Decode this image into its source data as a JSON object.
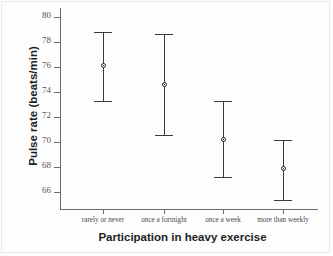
{
  "chart_data": {
    "type": "scatter",
    "title": "",
    "xlabel": "Participation in heavy exercise",
    "ylabel": "Pulse rate (beats/min)",
    "categories": [
      "rarely or never",
      "once a fortnight",
      "once a week",
      "more than weekly"
    ],
    "series": [
      {
        "name": "mean pulse rate with 95% confidence interval",
        "values": [
          76.1,
          74.6,
          70.2,
          67.9
        ],
        "lower": [
          73.3,
          70.6,
          67.2,
          65.4
        ],
        "upper": [
          78.8,
          78.6,
          73.3,
          70.2
        ]
      }
    ],
    "ylim": [
      64.6,
      80.7
    ],
    "yticks": [
      66,
      68,
      70,
      72,
      74,
      76,
      78,
      80
    ],
    "ytick_labels": [
      "66",
      "68",
      "70",
      "72",
      "74",
      "76",
      "78",
      "80"
    ],
    "grid": false,
    "legend": "none",
    "marker": "circle-outline",
    "error_bar_style": "capped-vertical",
    "colors": {
      "marker": "#202020",
      "error_bar": "#3a3a3a",
      "axis": "#6d6d6d",
      "background": "#fdfdfd",
      "label_text": "#1d1d1d"
    }
  }
}
